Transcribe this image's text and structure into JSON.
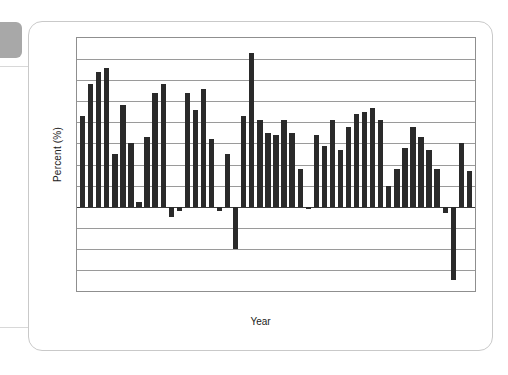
{
  "chart_data": {
    "type": "bar",
    "title": "",
    "xlabel": "Year",
    "ylabel": "Percent (%)",
    "ylim": [
      -4,
      8
    ],
    "ytick_values": [
      8,
      7,
      6,
      5,
      4,
      3,
      2,
      1,
      0,
      -1,
      -2,
      -3,
      -4
    ],
    "ytick_labels": [
      "8",
      "7",
      "6",
      "5",
      "4",
      "3",
      "2",
      "1",
      "0",
      "−1",
      "−2",
      "−3",
      "−4"
    ],
    "xtick_values": [
      1965,
      1970,
      1975,
      1980,
      1985,
      1990,
      1995,
      2000,
      2005,
      2010
    ],
    "xtick_labels": [
      "1965",
      "1970",
      "1975",
      "1980",
      "1985",
      "1990",
      "1995",
      "2000",
      "2005",
      "2010"
    ],
    "xlim": [
      1962.3,
      2011.7
    ],
    "grid": "horizontal",
    "legend": "none",
    "bar_color": "#2a2a2a",
    "categories": [
      1963,
      1964,
      1965,
      1966,
      1967,
      1968,
      1969,
      1970,
      1971,
      1972,
      1973,
      1974,
      1975,
      1976,
      1977,
      1978,
      1979,
      1980,
      1981,
      1982,
      1983,
      1984,
      1985,
      1986,
      1987,
      1988,
      1989,
      1990,
      1991,
      1992,
      1993,
      1994,
      1995,
      1996,
      1997,
      1998,
      1999,
      2000,
      2001,
      2002,
      2003,
      2004,
      2005,
      2006,
      2007,
      2008,
      2009,
      2010,
      2011
    ],
    "values": [
      4.3,
      5.8,
      6.4,
      6.6,
      2.5,
      4.8,
      3.0,
      0.2,
      3.3,
      5.4,
      5.8,
      -0.5,
      -0.2,
      5.4,
      4.6,
      5.6,
      3.2,
      -0.2,
      2.5,
      -2.0,
      4.3,
      7.3,
      4.1,
      3.5,
      3.4,
      4.1,
      3.5,
      1.8,
      -0.1,
      3.4,
      2.9,
      4.1,
      2.7,
      3.8,
      4.4,
      4.5,
      4.7,
      4.1,
      1.0,
      1.8,
      2.8,
      3.8,
      3.3,
      2.7,
      1.8,
      -0.3,
      -3.5,
      3.0,
      1.7
    ],
    "values_note": "Annual percent change; negative in 1974, 1975, 1980, 1982, 1991, 2008, 2009"
  },
  "axes": {
    "ylabel": "Percent (%)",
    "xlabel": "Year"
  }
}
